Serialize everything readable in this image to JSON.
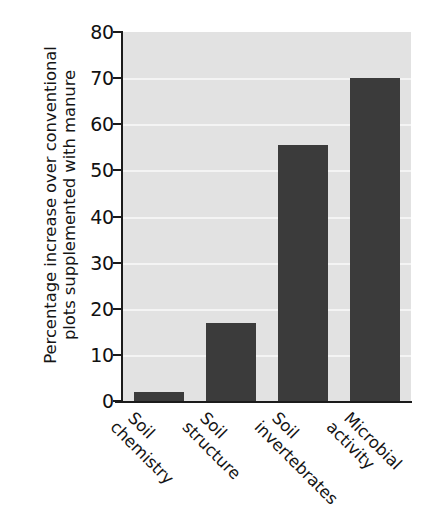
{
  "chart_data": {
    "type": "bar",
    "title": "",
    "xlabel": "",
    "ylabel": "Percentage increase over conventional plots supplemented with manure",
    "ylabel_lines": [
      "Percentage increase over conventional",
      "plots supplemented with manure"
    ],
    "categories": [
      "Soil chemistry",
      "Soil structure",
      "Soil invertebrates",
      "Microbial activity"
    ],
    "category_lines": [
      [
        "Soil",
        "chemistry"
      ],
      [
        "Soil",
        "structure"
      ],
      [
        "Soil",
        "invertebrates"
      ],
      [
        "Microbial",
        "activity"
      ]
    ],
    "values": [
      2,
      17,
      55.5,
      70
    ],
    "ylim": [
      0,
      80
    ],
    "yticks": [
      0,
      10,
      20,
      30,
      40,
      50,
      60,
      70,
      80
    ],
    "ytick_labels": [
      "0",
      "10",
      "20",
      "30",
      "40",
      "50",
      "60",
      "70",
      "80"
    ],
    "grid": true,
    "grid_axis": "y",
    "legend": false,
    "legend_position": "none",
    "colors": {
      "bar_fill": "#3b3b3b",
      "plot_background": "#e2e2e2",
      "gridline": "#f4f4f4",
      "axis": "#1b1b1b",
      "text": "#141414",
      "figure_background": "#ffffff"
    }
  }
}
